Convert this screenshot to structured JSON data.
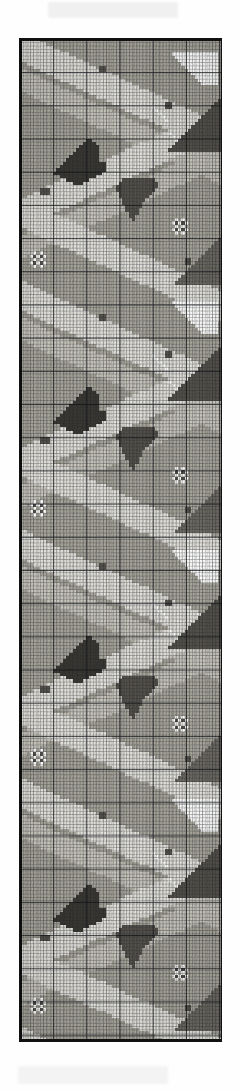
{
  "document": {
    "kind": "scanned-needlepoint-pattern-chart",
    "title": "Needlepoint Pattern Chart",
    "description": "Scanned graph-paper chart: vertical border strip of a diagonal lattice with pixelated floral and leaf motifs",
    "orientation": "portrait",
    "page": {
      "width": 241,
      "height": 1090,
      "background": "#fefefe"
    }
  },
  "chart": {
    "x": 19,
    "y": 38,
    "width": 203,
    "height": 1004,
    "border_color": "#111111",
    "paper_color": "#f7f6f3",
    "grid": {
      "cell_px": 3.32,
      "heavy_every": 10,
      "fine_line_color": "#282c32",
      "heavy_line_color": "#0f1218",
      "columns": 61,
      "rows": 302
    },
    "repeat": {
      "motif_height_px": 251,
      "repeats": 4,
      "description": "diagonal zig-zag lattice forming diamonds, with flower and leaf clusters at the diamond centres"
    }
  },
  "palette": {
    "paper": "#f7f6f3",
    "white": "#fdfdfb",
    "light": "#e4e2dc",
    "mid_light": "#c9c6bd",
    "mid": "#a9a69c",
    "mid_dark": "#8a8780",
    "dark": "#6d6a63",
    "darker": "#55524c",
    "darkest": "#3a3833",
    "ink": "#111111"
  },
  "chart_data": {
    "type": "heatmap",
    "xlabel": "",
    "ylabel": "",
    "grid": true,
    "legend": "none",
    "cell_size": 3.32,
    "cols": 61,
    "rows": 302,
    "value_levels": [
      "white",
      "light",
      "mid_light",
      "mid",
      "mid_dark",
      "dark",
      "darker",
      "darkest"
    ],
    "tile_height_rows": 75,
    "tile": {
      "bands": [
        {
          "name": "band-down-light",
          "from": [
            0,
            2
          ],
          "to": [
            61,
            30
          ],
          "thickness": 9,
          "tone": "light"
        },
        {
          "name": "band-down-mid",
          "from": [
            0,
            12
          ],
          "to": [
            61,
            40
          ],
          "thickness": 7,
          "tone": "mid_light"
        },
        {
          "name": "band-up-light",
          "from": [
            0,
            52
          ],
          "to": [
            61,
            24
          ],
          "thickness": 9,
          "tone": "light"
        },
        {
          "name": "band-up-mid",
          "from": [
            0,
            62
          ],
          "to": [
            61,
            34
          ],
          "thickness": 7,
          "tone": "mid_light"
        },
        {
          "name": "band-down-light2",
          "from": [
            0,
            52
          ],
          "to": [
            61,
            80
          ],
          "thickness": 9,
          "tone": "light"
        }
      ],
      "field_tone": "mid",
      "motifs": [
        {
          "name": "leaf-spray-left",
          "origin": [
            12,
            32
          ],
          "tone": "darkest",
          "shape": "triangular leaf pointing up-right"
        },
        {
          "name": "leaf-spray-right",
          "origin": [
            30,
            40
          ],
          "tone": "darker",
          "shape": "triangular leaf pointing down-right"
        },
        {
          "name": "flower-dots",
          "origin": [
            41,
            22
          ],
          "tone": "white",
          "shape": "diagonal dotted arc"
        },
        {
          "name": "bud-square-a",
          "origin": [
            44,
            20
          ],
          "tone": "darker",
          "shape": "2x2 square bud"
        },
        {
          "name": "bud-square-b",
          "origin": [
            52,
            29
          ],
          "tone": "dark",
          "shape": "2x2 square bud"
        },
        {
          "name": "bud-square-c",
          "origin": [
            7,
            46
          ],
          "tone": "darker",
          "shape": "3x2 square bud"
        },
        {
          "name": "four-petal",
          "origin": [
            47,
            56
          ],
          "tone": "white",
          "shape": "4 white cells around a dark centre"
        }
      ]
    }
  },
  "artifacts": {
    "top_smudge": {
      "x": 48,
      "y": 2,
      "width": 130,
      "height": 16,
      "color": "#d9d9d9"
    },
    "bottom_smudge": {
      "x": 18,
      "y": 1066,
      "width": 150,
      "height": 18,
      "color": "#dcdcdc"
    },
    "bottom_rule": {
      "x": 19,
      "y": 1040,
      "width": 203,
      "height": 2,
      "color": "#111111"
    }
  }
}
